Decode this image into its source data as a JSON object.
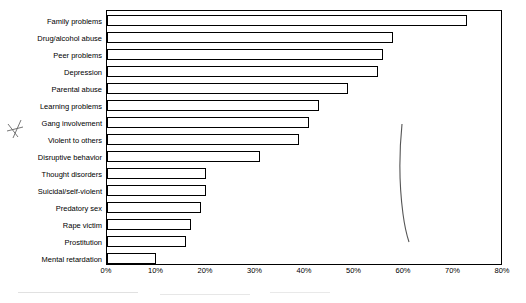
{
  "chart_data": {
    "type": "bar",
    "orientation": "horizontal",
    "title": "",
    "xlabel": "",
    "ylabel": "",
    "xlim": [
      0,
      80
    ],
    "xticks": [
      "0%",
      "10%",
      "20%",
      "30%",
      "40%",
      "50%",
      "60%",
      "70%",
      "80%"
    ],
    "xtick_values": [
      0,
      10,
      20,
      30,
      40,
      50,
      60,
      70,
      80
    ],
    "grid": false,
    "legend": null,
    "categories": [
      "Family problems",
      "Drug/alcohol abuse",
      "Peer problems",
      "Depression",
      "Parental abuse",
      "Learning problems",
      "Gang involvement",
      "Violent to others",
      "Disruptive behavior",
      "Thought disorders",
      "Suicidal/self-violent",
      "Predatory sex",
      "Rape victim",
      "Prostitution",
      "Mental retardation"
    ],
    "values": [
      73,
      58,
      56,
      55,
      49,
      43,
      41,
      39,
      31,
      20,
      20,
      19,
      17,
      16,
      10
    ],
    "bar_fill": "#ffffff",
    "bar_edge": "#000000"
  },
  "annotations": {
    "pen_mark": "handwritten-check-mark",
    "pen_curve": "handwritten-vertical-curve"
  }
}
